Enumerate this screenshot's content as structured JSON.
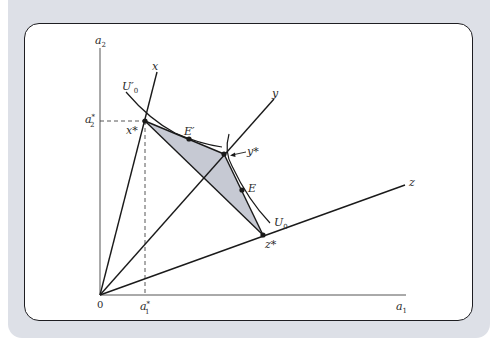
{
  "figure": {
    "axes": {
      "x_label": "a",
      "x_label_sub": "1",
      "y_label": "a",
      "y_label_sub": "2",
      "origin_label": "0"
    },
    "rays": [
      {
        "id": "x",
        "label": "x"
      },
      {
        "id": "y",
        "label": "y"
      },
      {
        "id": "z",
        "label": "z"
      }
    ],
    "points": {
      "x_star": "x*",
      "y_star": "y*",
      "z_star": "z*",
      "E": "E",
      "E_prime": "E′"
    },
    "curves": {
      "U0": {
        "label": "U",
        "sub": "0"
      },
      "U0_prime": {
        "label": "U′",
        "sub": "0"
      }
    },
    "reference_lines": {
      "a1_star": {
        "label": "a",
        "sup": "*",
        "sub": "1"
      },
      "a2_star": {
        "label": "a",
        "sup": "*",
        "sub": "2"
      }
    },
    "annotations": {
      "y_star_arrow": "←"
    },
    "colors": {
      "backdrop": "#dde0e7",
      "card_border": "#1e1e22",
      "shaded_region": "#c6c9d3",
      "line": "#1a1a1a"
    }
  }
}
